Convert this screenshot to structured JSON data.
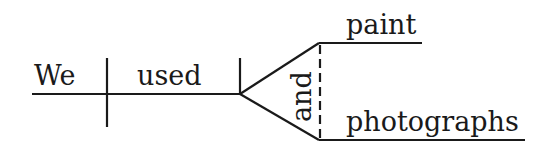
{
  "diagram": {
    "type": "sentence-diagram",
    "subject": "We",
    "verb": "used",
    "conjunction": "and",
    "objects": [
      "paint",
      "photographs"
    ],
    "line_color": "#1a1a1a"
  }
}
